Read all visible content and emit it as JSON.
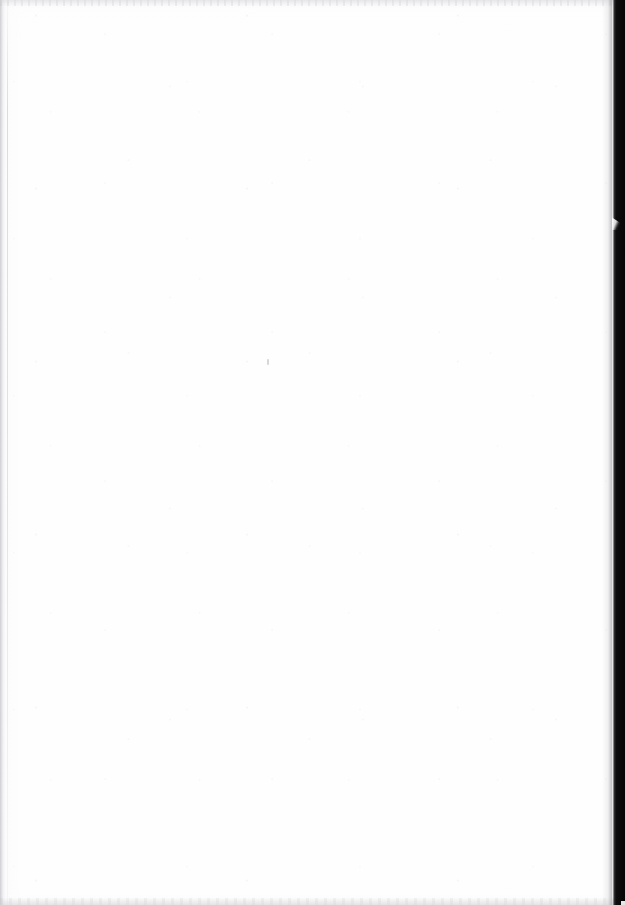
{
  "document": {
    "kind": "scanned-page",
    "page_label": "",
    "body_text": "",
    "is_blank": "true",
    "orientation": "portrait",
    "width_px": "625",
    "height_px": "905"
  },
  "canvas": {
    "paper_color": "#fefefe",
    "background_color": "#ffffff"
  },
  "artifacts": {
    "right_dark_band": {
      "name": "scanner-background-band",
      "color": "#060607",
      "edge_highlight_color": "#3a3a3c",
      "left_px": "612",
      "width_px": "13"
    },
    "right_edge_notch": {
      "name": "page-edge-notch",
      "color": "#ffffff",
      "top_px": "216",
      "height_px": "14"
    },
    "right_corner_chip": {
      "name": "bottom-right-corner-chip",
      "color": "#ffffff"
    },
    "right_edge_shadow": {
      "name": "page-edge-shadow",
      "color": "#8c8c90"
    },
    "left_guide_line": {
      "name": "left-margin-line",
      "color": "#cecfd2",
      "left_px": "7"
    },
    "left_edge_smudge": {
      "name": "left-trim-smudge",
      "color": "#c4c4c8"
    },
    "top_edge_speckle": {
      "name": "top-trim-speckle",
      "color": "#cecfd2"
    },
    "bottom_edge_line": {
      "name": "bottom-trim-line",
      "color": "#cacace"
    },
    "stray_speck": {
      "name": "stray-ink-speck",
      "color": "#b6b6bc",
      "x_px": "267",
      "y_px": "359"
    },
    "scan_noise": {
      "name": "sensor-noise",
      "color": "#c2c2c6"
    }
  }
}
